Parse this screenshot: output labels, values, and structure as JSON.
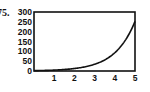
{
  "problem": {
    "label": "75."
  },
  "chart_data": {
    "type": "line",
    "title": "",
    "xlabel": "",
    "ylabel": "",
    "xlim": [
      0,
      5
    ],
    "ylim": [
      0,
      300
    ],
    "x_ticks": [
      1,
      2,
      3,
      4,
      5
    ],
    "y_ticks": [
      0,
      50,
      100,
      150,
      200,
      250,
      300
    ],
    "grid": false,
    "legend": null,
    "series": [
      {
        "name": "curve",
        "x": [
          0,
          0.5,
          1,
          1.5,
          2,
          2.5,
          3,
          3.5,
          4,
          4.5,
          5
        ],
        "values": [
          1.7,
          2.8,
          4.6,
          7.6,
          12.6,
          20.7,
          34.1,
          56.3,
          92.8,
          153,
          252
        ]
      }
    ],
    "color": "#111111"
  }
}
